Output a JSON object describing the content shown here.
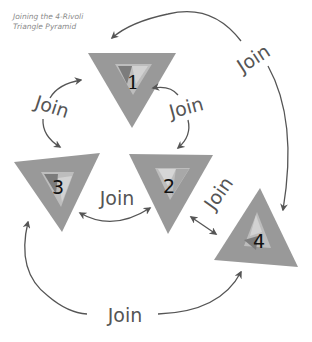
{
  "caption": {
    "line1": "Joining the 4-Rivoli",
    "line2": "Triangle Pyramid"
  },
  "colors": {
    "triangle_fill": "#999999",
    "triangle_dark": "#8a8a8a",
    "inner_light": "#c8c8c8",
    "inner_mid": "#b0b0b0",
    "inner_dark": "#7a7a7a",
    "arrow": "#555555",
    "text": "#555555",
    "caption": "#8a8a8a"
  },
  "triangles": [
    {
      "id": "1",
      "label": "1",
      "orientation": "down"
    },
    {
      "id": "2",
      "label": "2",
      "orientation": "down"
    },
    {
      "id": "3",
      "label": "3",
      "orientation": "down"
    },
    {
      "id": "4",
      "label": "4",
      "orientation": "up"
    }
  ],
  "joins": [
    {
      "id": "join-1-3",
      "label": "Join",
      "from": "1",
      "to": "3"
    },
    {
      "id": "join-1-2",
      "label": "Join",
      "from": "1",
      "to": "2"
    },
    {
      "id": "join-3-2",
      "label": "Join",
      "from": "3",
      "to": "2"
    },
    {
      "id": "join-2-4",
      "label": "Join",
      "from": "2",
      "to": "4"
    },
    {
      "id": "join-1-4",
      "label": "Join",
      "from": "4",
      "to": "1"
    },
    {
      "id": "join-3-4",
      "label": "Join",
      "from": "3",
      "to": "4"
    }
  ]
}
